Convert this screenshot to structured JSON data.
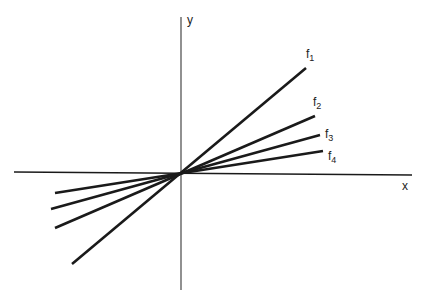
{
  "diagram": {
    "type": "line",
    "axes": {
      "x_label": "x",
      "y_label": "y"
    },
    "lines": [
      {
        "name": "f",
        "sub": "1",
        "x1": 72,
        "y1": 264,
        "x2": 306,
        "y2": 68
      },
      {
        "name": "f",
        "sub": "2",
        "x1": 55,
        "y1": 228,
        "x2": 315,
        "y2": 116
      },
      {
        "name": "f",
        "sub": "3",
        "x1": 51,
        "y1": 209,
        "x2": 320,
        "y2": 135
      },
      {
        "name": "f",
        "sub": "4",
        "x1": 55,
        "y1": 193,
        "x2": 323,
        "y2": 151
      }
    ],
    "colors": {
      "line": "#1a1a1a",
      "background": "#ffffff"
    }
  }
}
